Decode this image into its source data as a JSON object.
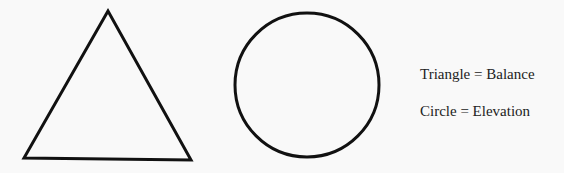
{
  "shapes": {
    "triangle": {
      "label": "Triangle",
      "points": "108,11 24,158 191,160",
      "stroke": "#111111",
      "stroke_width": 3
    },
    "circle": {
      "label": "Circle",
      "cx": 307,
      "cy": 85,
      "r": 72,
      "stroke": "#111111",
      "stroke_width": 3
    }
  },
  "legend": {
    "items": [
      {
        "text": "Triangle = Balance"
      },
      {
        "text": "Circle = Elevation"
      }
    ]
  }
}
